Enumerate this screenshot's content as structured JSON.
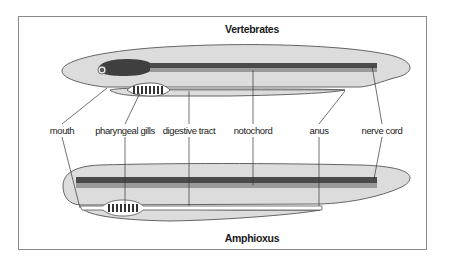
{
  "diagram": {
    "top_title": "Vertebrates",
    "bottom_title": "Amphioxus",
    "labels": [
      {
        "id": "mouth",
        "text": "mouth",
        "x": 62
      },
      {
        "id": "pharyngeal-gills",
        "text": "pharyngeal gills",
        "x": 125
      },
      {
        "id": "digestive-tract",
        "text": "digestive tract",
        "x": 189
      },
      {
        "id": "notochord",
        "text": "notochord",
        "x": 253
      },
      {
        "id": "anus",
        "text": "anus",
        "x": 319
      },
      {
        "id": "nerve-cord",
        "text": "nerve cord",
        "x": 382
      }
    ],
    "colors": {
      "body_fill": "#dcdcdc",
      "outline": "#555555",
      "nerve_cord": "#4a4a4a",
      "notochord": "#9a9a9a",
      "brain": "#3f3f3f",
      "gill_slit": "#333333",
      "frame": "#8a8a8a"
    }
  }
}
